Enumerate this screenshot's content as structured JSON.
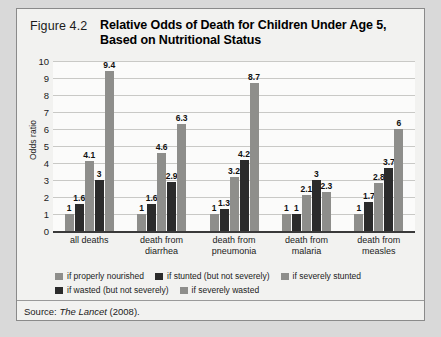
{
  "figure": {
    "number": "Figure 4.2",
    "title": "Relative Odds of Death for Children Under Age 5, Based on Nutritional Status",
    "source_prefix": "Source:",
    "source_italic": "The Lancet",
    "source_suffix": "(2008)."
  },
  "colors": {
    "light_gray": "#8e8e8b",
    "dark": "#2b2b2b",
    "plot_background": "#fbfbfa",
    "card_background": "#f2f2f0",
    "gridline": "#c9c9c6",
    "page_background": "#d9d9d9"
  },
  "legend": {
    "rows": [
      [
        {
          "label": "if properly nourished",
          "tone": "light"
        },
        {
          "label": "if stunted (but not severely)",
          "tone": "dark"
        },
        {
          "label": "if severely stunted",
          "tone": "light"
        }
      ],
      [
        {
          "label": "if wasted (but not severely)",
          "tone": "dark"
        },
        {
          "label": "if severely wasted",
          "tone": "light"
        }
      ]
    ]
  },
  "chart_data": {
    "type": "bar",
    "title": "Relative Odds of Death for Children Under Age 5, Based on Nutritional Status",
    "xlabel": "",
    "ylabel": "Odds ratio",
    "ylim": [
      0,
      10
    ],
    "yticks": [
      10,
      9,
      8,
      7,
      6,
      5,
      4,
      3,
      2,
      1,
      0
    ],
    "grid": true,
    "legend_position": "bottom",
    "categories": [
      "all deaths",
      "death from diarrhea",
      "death from pneumonia",
      "death from malaria",
      "death from measles"
    ],
    "series": [
      {
        "name": "if properly nourished",
        "tone": "light",
        "values": [
          1,
          1,
          1,
          1,
          1
        ]
      },
      {
        "name": "if stunted (but not severely)",
        "tone": "dark",
        "values": [
          1.6,
          1.6,
          1.3,
          1,
          1.7
        ]
      },
      {
        "name": "if severely stunted",
        "tone": "light",
        "values": [
          4.1,
          4.6,
          3.2,
          2.1,
          2.8
        ]
      },
      {
        "name": "if wasted (but not severely)",
        "tone": "dark",
        "values": [
          3,
          2.9,
          4.2,
          3,
          3.7
        ]
      },
      {
        "name": "if severely wasted",
        "tone": "light",
        "values": [
          9.4,
          6.3,
          8.7,
          2.3,
          6
        ]
      }
    ],
    "value_labels": [
      [
        "1",
        "1.6",
        "4.1",
        "3",
        "9.4"
      ],
      [
        "1",
        "1.6",
        "4.6",
        "2.9",
        "6.3"
      ],
      [
        "1",
        "1.3",
        "3.2",
        "4.2",
        "8.7"
      ],
      [
        "1",
        "1",
        "2.1",
        "3",
        "2.3"
      ],
      [
        "1",
        "1.7",
        "2.8",
        "3.7",
        "6"
      ]
    ]
  }
}
